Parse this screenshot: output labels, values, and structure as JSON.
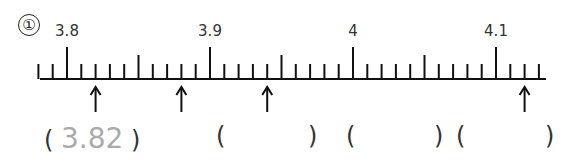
{
  "problem_number": "①",
  "number_line": {
    "start": 3.78,
    "end": 4.13,
    "step": 0.01,
    "major_labels": [
      {
        "value": 3.8,
        "text": "3.8"
      },
      {
        "value": 3.9,
        "text": "3.9"
      },
      {
        "value": 4.0,
        "text": "4"
      },
      {
        "value": 4.1,
        "text": "4.1"
      }
    ],
    "arrows": [
      3.82,
      3.88,
      3.94,
      4.12
    ]
  },
  "answers": [
    {
      "value": "3.82",
      "filled": true
    },
    {
      "value": "",
      "filled": false
    },
    {
      "value": "",
      "filled": false
    },
    {
      "value": "",
      "filled": false
    }
  ]
}
